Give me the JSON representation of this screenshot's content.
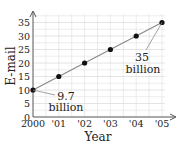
{
  "chart_data": {
    "type": "line",
    "title": "",
    "xlabel": "Year",
    "ylabel": "E-mail",
    "categories": [
      "2000",
      "'01",
      "'02",
      "'03",
      "'04",
      "'05"
    ],
    "x": [
      2000,
      2001,
      2002,
      2003,
      2004,
      2005
    ],
    "series": [
      {
        "name": "E-mail",
        "values": [
          10,
          15,
          20,
          25,
          30,
          35
        ]
      }
    ],
    "y_ticks": [
      0,
      5,
      10,
      15,
      20,
      25,
      30,
      35
    ],
    "ylim": [
      0,
      38
    ],
    "grid": true,
    "legend": "none",
    "annotations": [
      {
        "point_index": 0,
        "line1": "9.7",
        "line2": "billion"
      },
      {
        "point_index": 5,
        "line1": "35",
        "line2": "billion"
      }
    ],
    "colors": {
      "grid": "#dddddd",
      "axis": "#555555",
      "line": "#8a8a8a",
      "point": "#111111"
    }
  }
}
